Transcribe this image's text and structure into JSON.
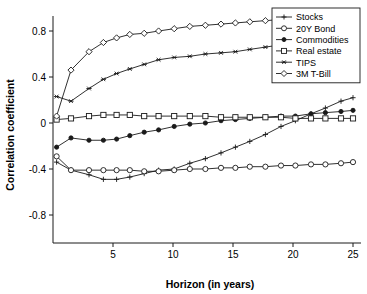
{
  "chart_data": {
    "type": "line",
    "title": "",
    "xlabel": "Horizon (in years)",
    "ylabel": "Correlation coefficient",
    "xlim": [
      0,
      25
    ],
    "ylim": [
      -1.0,
      1.0
    ],
    "xticks": [
      5,
      10,
      15,
      20,
      25
    ],
    "yticks": [
      0.8,
      0.4,
      0,
      -0.4,
      -0.8
    ],
    "xtick_labels": [
      "5",
      "10",
      "15",
      "20",
      "25"
    ],
    "ytick_labels": [
      "0.8",
      "0.4",
      "0",
      "-0.4",
      "-0.8"
    ],
    "grid": false,
    "legend_position": "top-right",
    "x": [
      0.3,
      1.5,
      3.0,
      4.2,
      5.3,
      6.4,
      7.6,
      8.8,
      10.1,
      11.4,
      12.7,
      14.0,
      15.2,
      16.4,
      17.7,
      19.0,
      20.2,
      21.5,
      22.7,
      24.0,
      25.0
    ],
    "series": [
      {
        "name": "Stocks",
        "marker": "plus",
        "values": [
          -0.34,
          -0.41,
          -0.45,
          -0.49,
          -0.49,
          -0.47,
          -0.44,
          -0.41,
          -0.4,
          -0.35,
          -0.31,
          -0.26,
          -0.21,
          -0.16,
          -0.1,
          -0.03,
          0.02,
          0.08,
          0.13,
          0.19,
          0.22
        ]
      },
      {
        "name": "20Y Bond",
        "marker": "circle-open",
        "values": [
          -0.29,
          -0.41,
          -0.41,
          -0.41,
          -0.41,
          -0.41,
          -0.42,
          -0.42,
          -0.41,
          -0.4,
          -0.4,
          -0.39,
          -0.39,
          -0.38,
          -0.38,
          -0.37,
          -0.37,
          -0.36,
          -0.36,
          -0.35,
          -0.34
        ]
      },
      {
        "name": "Commodities",
        "marker": "circle-filled",
        "values": [
          -0.21,
          -0.13,
          -0.15,
          -0.15,
          -0.14,
          -0.11,
          -0.08,
          -0.06,
          -0.03,
          -0.01,
          0.0,
          0.02,
          0.03,
          0.04,
          0.05,
          0.06,
          0.06,
          0.08,
          0.09,
          0.1,
          0.11
        ]
      },
      {
        "name": "Real estate",
        "marker": "square-open",
        "values": [
          0.03,
          0.04,
          0.06,
          0.07,
          0.07,
          0.07,
          0.06,
          0.06,
          0.06,
          0.06,
          0.06,
          0.05,
          0.05,
          0.05,
          0.05,
          0.05,
          0.04,
          0.04,
          0.04,
          0.04,
          0.04
        ]
      },
      {
        "name": "TIPS",
        "marker": "asterisk",
        "values": [
          0.23,
          0.19,
          0.3,
          0.38,
          0.43,
          0.47,
          0.51,
          0.55,
          0.57,
          0.58,
          0.6,
          0.61,
          0.62,
          0.64,
          0.66,
          0.68,
          0.7,
          0.72,
          0.74,
          0.76,
          0.78
        ]
      },
      {
        "name": "3M T-Bill",
        "marker": "diamond-open",
        "values": [
          0.06,
          0.46,
          0.62,
          0.7,
          0.74,
          0.77,
          0.78,
          0.8,
          0.82,
          0.84,
          0.85,
          0.86,
          0.87,
          0.88,
          0.89,
          0.9,
          0.9,
          0.91,
          0.91,
          0.92,
          0.92
        ]
      }
    ],
    "legend": [
      {
        "label": "Stocks",
        "marker": "plus"
      },
      {
        "label": "20Y Bond",
        "marker": "circle-open"
      },
      {
        "label": "Commodities",
        "marker": "circle-filled"
      },
      {
        "label": "Real estate",
        "marker": "square-open"
      },
      {
        "label": "TIPS",
        "marker": "asterisk"
      },
      {
        "label": "3M T-Bill",
        "marker": "diamond-open"
      }
    ],
    "colors": {
      "line": "#1a1a1a",
      "axis": "#1a1a1a",
      "background": "#ffffff",
      "marker_fill": "#ffffff"
    }
  }
}
